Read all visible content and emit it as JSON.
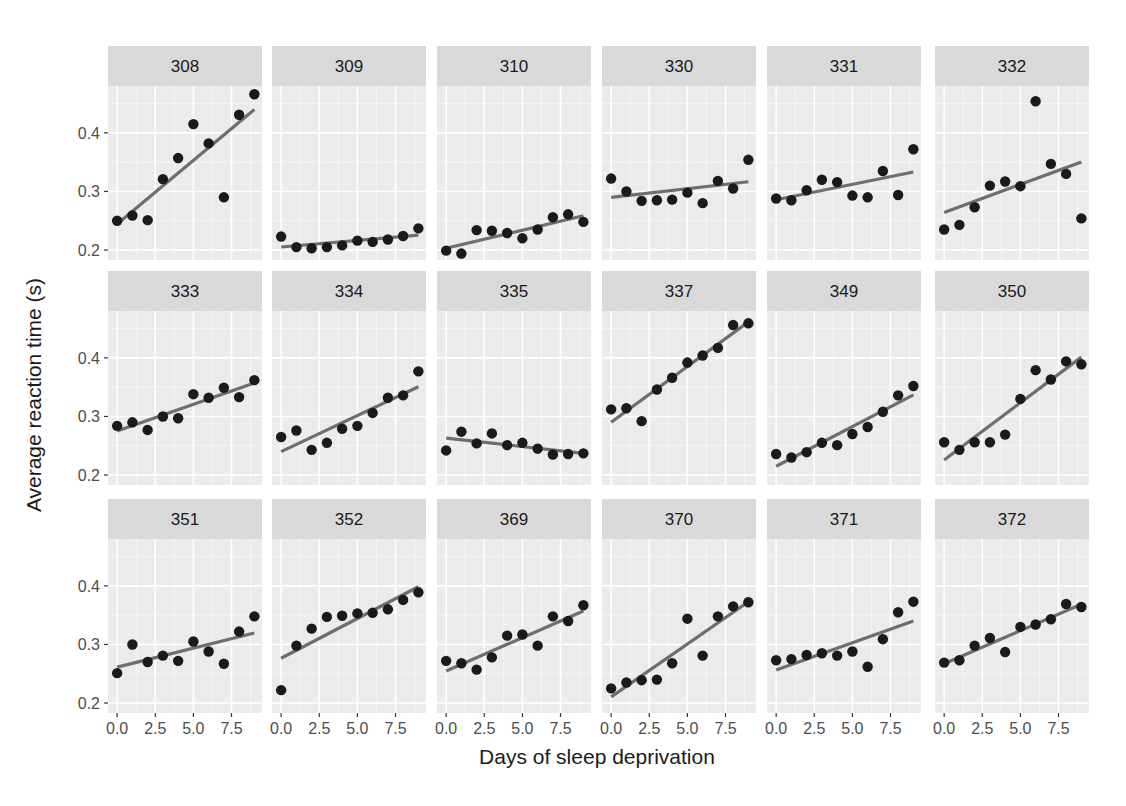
{
  "chart_data": {
    "type": "scatter",
    "title": "",
    "xlabel": "Days of sleep deprivation",
    "ylabel": "Average reaction time (s)",
    "facet_by": "Subject",
    "facet_layout": {
      "rows": 3,
      "cols": 6
    },
    "xlim": [
      -0.6,
      9.5
    ],
    "ylim": [
      0.183,
      0.48
    ],
    "x_ticks": [
      0.0,
      2.5,
      5.0,
      7.5
    ],
    "x_tick_labels": [
      "0.0",
      "2.5",
      "5.0",
      "7.5"
    ],
    "y_ticks": [
      0.2,
      0.3,
      0.4
    ],
    "y_tick_labels": [
      "0.2",
      "0.3",
      "0.4"
    ],
    "grid": true,
    "overlay": "linear fit per panel",
    "x": [
      0,
      1,
      2,
      3,
      4,
      5,
      6,
      7,
      8,
      9
    ],
    "series": [
      {
        "name": "308",
        "values": [
          0.25,
          0.259,
          0.251,
          0.321,
          0.357,
          0.415,
          0.382,
          0.29,
          0.431,
          0.466
        ]
      },
      {
        "name": "309",
        "values": [
          0.223,
          0.205,
          0.203,
          0.205,
          0.208,
          0.216,
          0.214,
          0.218,
          0.224,
          0.237
        ]
      },
      {
        "name": "310",
        "values": [
          0.199,
          0.194,
          0.234,
          0.233,
          0.229,
          0.22,
          0.235,
          0.256,
          0.261,
          0.248
        ]
      },
      {
        "name": "330",
        "values": [
          0.322,
          0.3,
          0.284,
          0.285,
          0.286,
          0.298,
          0.28,
          0.318,
          0.305,
          0.354
        ]
      },
      {
        "name": "331",
        "values": [
          0.288,
          0.285,
          0.302,
          0.32,
          0.316,
          0.293,
          0.29,
          0.335,
          0.294,
          0.372
        ]
      },
      {
        "name": "332",
        "values": [
          0.235,
          0.243,
          0.273,
          0.31,
          0.317,
          0.309,
          0.454,
          0.347,
          0.33,
          0.254
        ]
      },
      {
        "name": "333",
        "values": [
          0.284,
          0.29,
          0.277,
          0.3,
          0.297,
          0.338,
          0.332,
          0.349,
          0.333,
          0.362
        ]
      },
      {
        "name": "334",
        "values": [
          0.265,
          0.276,
          0.243,
          0.255,
          0.279,
          0.284,
          0.306,
          0.332,
          0.336,
          0.377
        ]
      },
      {
        "name": "335",
        "values": [
          0.242,
          0.274,
          0.254,
          0.271,
          0.251,
          0.255,
          0.245,
          0.235,
          0.236,
          0.237
        ]
      },
      {
        "name": "337",
        "values": [
          0.312,
          0.314,
          0.292,
          0.346,
          0.366,
          0.392,
          0.404,
          0.417,
          0.456,
          0.459
        ]
      },
      {
        "name": "349",
        "values": [
          0.236,
          0.23,
          0.239,
          0.255,
          0.251,
          0.27,
          0.282,
          0.308,
          0.336,
          0.352
        ]
      },
      {
        "name": "350",
        "values": [
          0.256,
          0.243,
          0.256,
          0.256,
          0.269,
          0.33,
          0.379,
          0.363,
          0.394,
          0.389
        ]
      },
      {
        "name": "351",
        "values": [
          0.251,
          0.3,
          0.27,
          0.281,
          0.272,
          0.305,
          0.288,
          0.267,
          0.322,
          0.348
        ]
      },
      {
        "name": "352",
        "values": [
          0.222,
          0.298,
          0.327,
          0.347,
          0.349,
          0.353,
          0.354,
          0.36,
          0.376,
          0.389
        ]
      },
      {
        "name": "369",
        "values": [
          0.272,
          0.268,
          0.257,
          0.278,
          0.315,
          0.317,
          0.298,
          0.348,
          0.34,
          0.367
        ]
      },
      {
        "name": "370",
        "values": [
          0.225,
          0.235,
          0.239,
          0.24,
          0.268,
          0.344,
          0.281,
          0.348,
          0.365,
          0.372
        ]
      },
      {
        "name": "371",
        "values": [
          0.273,
          0.275,
          0.282,
          0.285,
          0.281,
          0.288,
          0.262,
          0.309,
          0.355,
          0.373
        ]
      },
      {
        "name": "372",
        "values": [
          0.269,
          0.273,
          0.298,
          0.311,
          0.287,
          0.33,
          0.334,
          0.343,
          0.369,
          0.364
        ]
      }
    ]
  },
  "colors": {
    "panel_bg": "#ebebeb",
    "strip_bg": "#d9d9d9",
    "grid_major": "#ffffff",
    "grid_minor": "#f5f5f5",
    "point": "#1a1a1a",
    "fit_line": "#6e6e6e",
    "tick": "#333333"
  }
}
